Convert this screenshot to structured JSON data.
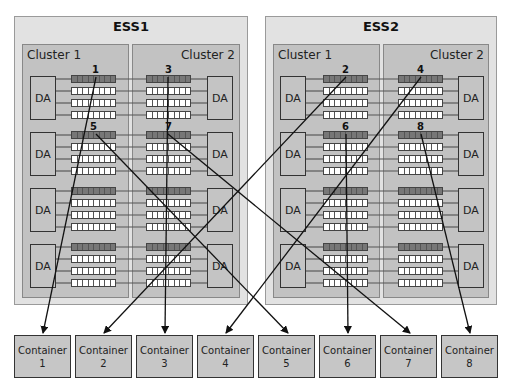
{
  "ess_units": [
    {
      "title": "ESS1",
      "clusters": [
        {
          "label": "Cluster 1"
        },
        {
          "label": "Cluster 2"
        }
      ]
    },
    {
      "title": "ESS2",
      "clusters": [
        {
          "label": "Cluster 1"
        },
        {
          "label": "Cluster 2"
        }
      ]
    }
  ],
  "da_label": "DA",
  "stream_numbers": [
    "1",
    "2",
    "3",
    "4",
    "5",
    "6",
    "7",
    "8"
  ],
  "containers": [
    {
      "label": "Container",
      "number": "1"
    },
    {
      "label": "Container",
      "number": "2"
    },
    {
      "label": "Container",
      "number": "3"
    },
    {
      "label": "Container",
      "number": "4"
    },
    {
      "label": "Container",
      "number": "5"
    },
    {
      "label": "Container",
      "number": "6"
    },
    {
      "label": "Container",
      "number": "7"
    },
    {
      "label": "Container",
      "number": "8"
    }
  ],
  "colors": {
    "ess_bg": "#e2e2e2",
    "cluster_bg": "#c2c2c2",
    "strip_dark": "#777777",
    "strip_light": "#ffffff",
    "container_bg": "#c6c6c6"
  }
}
